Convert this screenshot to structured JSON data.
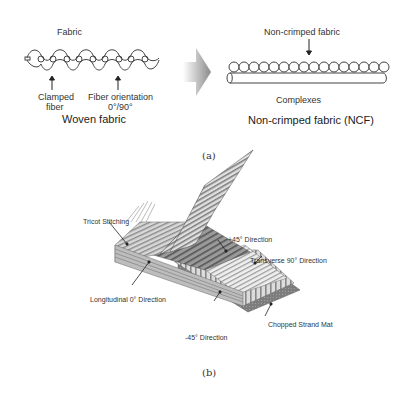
{
  "panel_a": {
    "woven": {
      "top_label": "Fabric",
      "label_clamped_line1": "Clamped",
      "label_clamped_line2": "fiber",
      "label_orientation_line1": "Fiber orientation",
      "label_orientation_line2": "0°/90°",
      "title": "Woven fabric"
    },
    "arrow_icon": "chevron-right-arrow",
    "ncf": {
      "top_label": "Non-crimped fabric",
      "bottom_label": "Complexes",
      "title": "Non-crimped fabric (NCF)"
    },
    "caption": "(a)"
  },
  "panel_b": {
    "labels": {
      "tricot": "Tricot Stitching",
      "plus45": "+45° Direction",
      "transverse": "Transverse 90° Direction",
      "longitudinal": "Longitudinal 0° Direction",
      "minus45": "-45° Direction",
      "chopped": "Chopped Strand Mat"
    },
    "caption": "(b)"
  }
}
